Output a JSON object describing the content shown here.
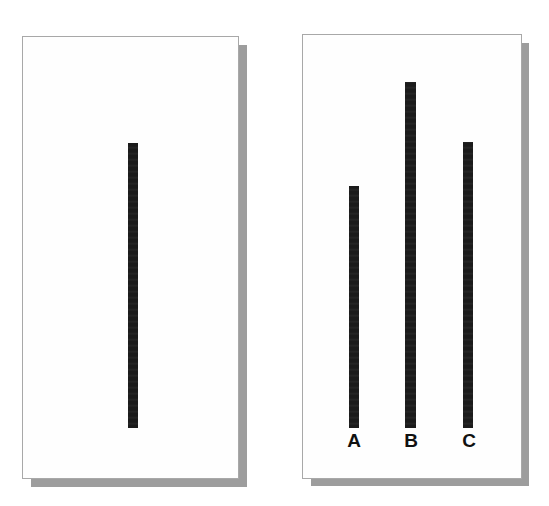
{
  "figure": {
    "background_color": "#ffffff",
    "panel_fill_color": "#fefefe",
    "panel_border_color": "#a8a8a8",
    "panel_shadow_color": "#9d9d9d",
    "bar_color": "#1b1b1b"
  },
  "chart_data": [
    {
      "type": "bar",
      "id": "left-panel-chart",
      "title": "",
      "xlabel": "",
      "ylabel": "",
      "categories": [
        ""
      ],
      "tick_labels": [],
      "values": [
        285
      ],
      "ylim": [
        0,
        443
      ],
      "grid": false,
      "legend": null,
      "notes": "Single unlabeled vertical black bar centered in an empty framed panel."
    },
    {
      "type": "bar",
      "id": "right-panel-chart",
      "title": "",
      "xlabel": "",
      "ylabel": "",
      "categories": [
        "A",
        "B",
        "C"
      ],
      "tick_labels": [
        "A",
        "B",
        "C"
      ],
      "values": [
        242,
        346,
        286
      ],
      "ylim": [
        0,
        443
      ],
      "grid": false,
      "legend": null,
      "notes": "Three vertical black bars on a common baseline, labeled A, B and C beneath each bar."
    }
  ],
  "left_panel": {
    "name": "left-panel",
    "bar": {
      "label": "",
      "value": 285
    }
  },
  "right_panel": {
    "name": "right-panel",
    "bars": [
      {
        "label": "A",
        "value": 242
      },
      {
        "label": "B",
        "value": 346
      },
      {
        "label": "C",
        "value": 286
      }
    ]
  }
}
